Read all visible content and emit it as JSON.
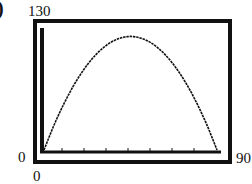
{
  "panel_marker": ")",
  "labels": {
    "ymax": "130",
    "ymin": "0",
    "xmin": "0",
    "xmax": "90"
  },
  "colors": {
    "frame": "#111111",
    "curve": "#111111",
    "background": "#ffffff"
  },
  "chart_data": {
    "type": "line",
    "title": "",
    "xlabel": "",
    "ylabel": "",
    "xlim": [
      0,
      90
    ],
    "ylim": [
      0,
      130
    ],
    "grid": false,
    "legend": null,
    "x_ticks_marks": 6,
    "tick_labels": {
      "x": [
        "0",
        "90"
      ],
      "y": [
        "0",
        "130"
      ]
    },
    "series": [
      {
        "name": "parabola",
        "x": [
          0,
          10,
          20,
          30,
          40,
          44,
          50,
          60,
          70,
          80,
          87
        ],
        "y": [
          0,
          50,
          87,
          110,
          120,
          121,
          119,
          107,
          83,
          47,
          0
        ]
      }
    ]
  }
}
